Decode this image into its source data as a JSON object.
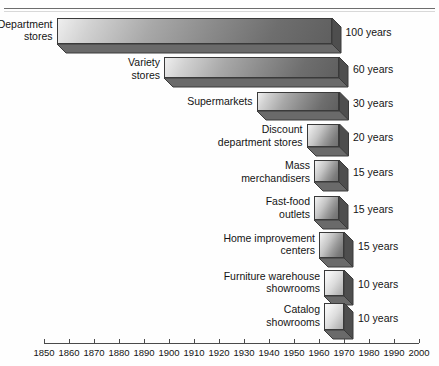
{
  "chart_data": {
    "type": "bar",
    "orientation": "horizontal",
    "title": "",
    "subtitle": "",
    "xlabel": "",
    "ylabel": "",
    "xlim": [
      1850,
      2000
    ],
    "xticks": [
      1850,
      1860,
      1870,
      1880,
      1890,
      1900,
      1910,
      1920,
      1930,
      1940,
      1950,
      1960,
      1970,
      1980,
      1990,
      2000
    ],
    "xtick_labels": [
      "1850",
      "1860",
      "1870",
      "1880",
      "1890",
      "1900",
      "1910",
      "1920",
      "1930",
      "1940",
      "1950",
      "1960",
      "1970",
      "1980",
      "1990",
      "2000"
    ],
    "grid": false,
    "legend": null,
    "value_unit": "years",
    "categories": [
      "Department stores",
      "Variety stores",
      "Supermarkets",
      "Discount department stores",
      "Mass merchandisers",
      "Fast-food outlets",
      "Home improvement centers",
      "Furniture warehouse showrooms",
      "Catalog showrooms"
    ],
    "values": [
      100,
      60,
      30,
      20,
      15,
      15,
      15,
      10,
      10
    ],
    "spans": [
      {
        "start": 1855,
        "end": 1965
      },
      {
        "start": 1898,
        "end": 1968
      },
      {
        "start": 1935,
        "end": 1968
      },
      {
        "start": 1955,
        "end": 1968
      },
      {
        "start": 1958,
        "end": 1968
      },
      {
        "start": 1958,
        "end": 1968
      },
      {
        "start": 1960,
        "end": 1970
      },
      {
        "start": 1962,
        "end": 1970
      },
      {
        "start": 1962,
        "end": 1970
      }
    ]
  },
  "bars": [
    {
      "label_line1": "Department",
      "label_line2": "stores",
      "value_label": "100 years",
      "style": "dark"
    },
    {
      "label_line1": "Variety",
      "label_line2": "stores",
      "value_label": "60 years",
      "style": "dark"
    },
    {
      "label_line1": "Supermarkets",
      "label_line2": "",
      "value_label": "30 years",
      "style": "dark"
    },
    {
      "label_line1": "Discount",
      "label_line2": "department stores",
      "value_label": "20 years",
      "style": "normal"
    },
    {
      "label_line1": "Mass",
      "label_line2": "merchandisers",
      "value_label": "15 years",
      "style": "normal"
    },
    {
      "label_line1": "Fast-food",
      "label_line2": "outlets",
      "value_label": "15 years",
      "style": "normal"
    },
    {
      "label_line1": "Home improvement",
      "label_line2": "centers",
      "value_label": "15 years",
      "style": "normal"
    },
    {
      "label_line1": "Furniture warehouse",
      "label_line2": "showrooms",
      "value_label": "10 years",
      "style": "pale"
    },
    {
      "label_line1": "Catalog",
      "label_line2": "showrooms",
      "value_label": "10 years",
      "style": "pale"
    }
  ],
  "axis": {
    "ticks": [
      "1850",
      "1860",
      "1870",
      "1880",
      "1890",
      "1900",
      "1910",
      "1920",
      "1930",
      "1940",
      "1950",
      "1960",
      "1970",
      "1980",
      "1990",
      "2000"
    ]
  },
  "colors": {
    "bar_light": "#f4f4f4",
    "bar_mid": "#9a9a9a",
    "bar_dark": "#5f5f5f",
    "outline": "#3a3a3a",
    "axis": "#4a4a4a",
    "text": "#141414",
    "background": "#ffffff"
  }
}
